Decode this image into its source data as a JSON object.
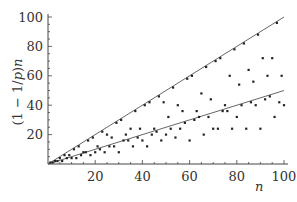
{
  "chart_data": {
    "type": "scatter",
    "title": "",
    "xlabel": "n",
    "ylabel": "(1 − 1/p)n",
    "xlim": [
      0,
      100
    ],
    "ylim": [
      0,
      100
    ],
    "xticks": [
      20,
      40,
      60,
      80,
      100
    ],
    "yticks": [
      20,
      40,
      60,
      80,
      100
    ],
    "grid": false,
    "legend": null,
    "series": [
      {
        "name": "points",
        "type": "scatter",
        "x": [
          1,
          2,
          3,
          4,
          5,
          6,
          7,
          8,
          9,
          10,
          11,
          12,
          13,
          14,
          15,
          16,
          17,
          18,
          19,
          20,
          21,
          22,
          23,
          24,
          25,
          26,
          27,
          28,
          29,
          30,
          31,
          32,
          33,
          34,
          35,
          36,
          37,
          38,
          39,
          40,
          41,
          42,
          43,
          44,
          45,
          46,
          47,
          48,
          49,
          50,
          51,
          52,
          53,
          54,
          55,
          56,
          57,
          58,
          59,
          60,
          61,
          62,
          63,
          64,
          65,
          66,
          67,
          68,
          69,
          70,
          71,
          72,
          73,
          74,
          75,
          76,
          77,
          78,
          79,
          80,
          81,
          82,
          83,
          84,
          85,
          86,
          87,
          88,
          89,
          90,
          91,
          92,
          93,
          94,
          95,
          96,
          97,
          98,
          99,
          100
        ],
        "y": [
          1,
          1,
          2,
          2,
          4,
          2,
          6,
          4,
          6,
          4,
          10,
          4,
          12,
          6,
          8,
          8,
          16,
          6,
          18,
          8,
          12,
          10,
          22,
          8,
          20,
          12,
          18,
          12,
          28,
          8,
          30,
          16,
          20,
          16,
          24,
          12,
          36,
          18,
          24,
          16,
          40,
          12,
          42,
          20,
          24,
          22,
          46,
          16,
          42,
          20,
          32,
          24,
          52,
          18,
          40,
          24,
          36,
          28,
          58,
          16,
          60,
          30,
          36,
          32,
          48,
          20,
          66,
          32,
          44,
          24,
          70,
          24,
          72,
          36,
          40,
          36,
          60,
          24,
          78,
          32,
          54,
          40,
          82,
          24,
          64,
          42,
          56,
          40,
          88,
          24,
          72,
          44,
          60,
          46,
          72,
          32,
          96,
          42,
          60,
          40
        ]
      },
      {
        "name": "upper line",
        "type": "line",
        "x": [
          0,
          100
        ],
        "y": [
          0,
          100
        ]
      },
      {
        "name": "lower line",
        "type": "line",
        "x": [
          0,
          100
        ],
        "y": [
          0,
          50
        ]
      }
    ]
  },
  "axes": {
    "x_title": "n",
    "y_title": "(1 − 1/p)n"
  }
}
